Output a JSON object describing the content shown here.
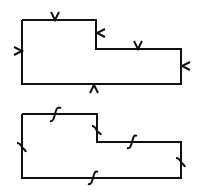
{
  "figures": [
    {
      "id": "top-polygon",
      "description": "L-shaped polygon with chevron (arrow-tick) marks on each edge",
      "mark_type": "chevron",
      "outline": [
        [
          22,
          20
        ],
        [
          96,
          20
        ],
        [
          96,
          49
        ],
        [
          181,
          49
        ],
        [
          181,
          84
        ],
        [
          22,
          84
        ]
      ]
    },
    {
      "id": "bottom-polygon",
      "description": "L-shaped polygon with S-curve (integral-like) marks on each edge",
      "mark_type": "s-curve",
      "outline": [
        [
          22,
          114
        ],
        [
          97,
          114
        ],
        [
          97,
          142
        ],
        [
          181,
          142
        ],
        [
          181,
          178
        ],
        [
          22,
          178
        ]
      ]
    }
  ],
  "colors": {
    "stroke": "#000000",
    "background": "#ffffff"
  }
}
